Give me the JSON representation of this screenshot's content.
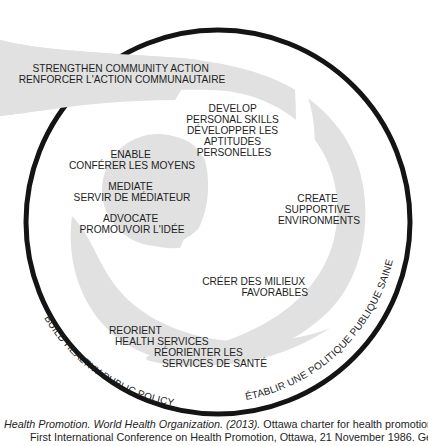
{
  "diagram": {
    "colors": {
      "shape_fill": "#e1e1e1",
      "ring_stroke": "#141414",
      "text": "#1e1e1e",
      "background": "#ffffff"
    },
    "outer_ring": {
      "left_label": "BUILD HEALTHY PUBLIC POLICY",
      "right_label": "ÉTABLIR UNE POLITIQUE PUBLIQUE SAINE"
    },
    "outer_arm": {
      "line1": "STRENGTHEN COMMUNITY ACTION",
      "line2": "RENFORCER L'ACTION COMMUNAUTAIRE"
    },
    "develop": {
      "lines": [
        "DEVELOP",
        "PERSONAL SKILLS",
        "DÉVELOPPER LES",
        "APTITUDES",
        "PERSONELLES"
      ]
    },
    "inner_circle": {
      "enable": [
        "ENABLE",
        "CONFÉRER LES MOYENS"
      ],
      "mediate": [
        "MEDIATE",
        "SERVIR DE MÉDIATEUR"
      ],
      "advocate": [
        "ADVOCATE",
        "PROMOUVOIR L'IDÉE"
      ]
    },
    "create": {
      "lines": [
        "CREATE",
        "SUPPORTIVE",
        "ENVIRONMENTS"
      ]
    },
    "creer": {
      "lines": [
        "CRÉER DES MILIEUX",
        "FAVORABLES"
      ]
    },
    "reorient": {
      "en": [
        "REORIENT",
        "HEALTH SERVICES"
      ],
      "fr": [
        "RÉORIENTER LES",
        "SERVICES DE SANTÉ"
      ]
    }
  },
  "caption": {
    "source_italic": "Health Promotion. World Health Organization. (2013).",
    "source_rest": " Ottawa charter for health promotion:",
    "line2": "First International Conference on Health Promotion, Ottawa, 21 November 1986. Geneva: Author. Retrieved from http://www.who.int"
  }
}
